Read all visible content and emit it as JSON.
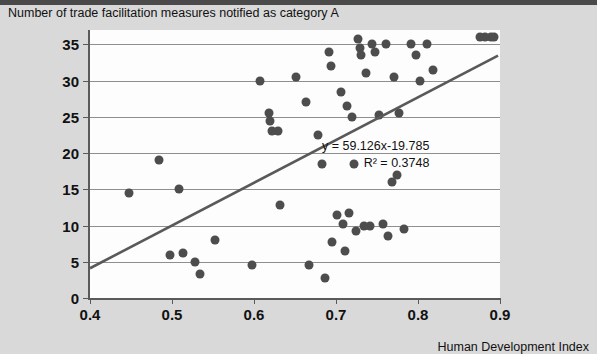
{
  "chart_data": {
    "type": "scatter",
    "title": "",
    "xlabel": "Human Development Index",
    "ylabel": "Number of trade facilitation measures notified as category A",
    "xlim": [
      0.4,
      0.9
    ],
    "ylim": [
      0,
      37
    ],
    "xticks": [
      "0.4",
      "0.5",
      "0.6",
      "0.7",
      "0.8",
      "0.9"
    ],
    "xtick_values": [
      0.4,
      0.5,
      0.6,
      0.7,
      0.8,
      0.9
    ],
    "yticks": [
      "0",
      "5",
      "10",
      "15",
      "20",
      "25",
      "30",
      "35"
    ],
    "ytick_values": [
      0,
      5,
      10,
      15,
      20,
      25,
      30,
      35
    ],
    "grid": "horizontal",
    "legend": "none",
    "annotations": [
      "y = 59.126x-19.785",
      "R² = 0.3748"
    ],
    "trendline": {
      "type": "linear",
      "equation": "y = 59.126x-19.785",
      "slope": 59.126,
      "intercept": -19.785,
      "r_squared": 0.3748,
      "x_start": 0.4,
      "x_end": 0.9,
      "y_start": 3.86,
      "y_end": 33.43,
      "color": "#595959"
    },
    "point_color": "#4d4d4d",
    "points": [
      [
        0.447,
        14.5
      ],
      [
        0.484,
        19.0
      ],
      [
        0.497,
        6.0
      ],
      [
        0.508,
        15.0
      ],
      [
        0.513,
        6.2
      ],
      [
        0.528,
        5.0
      ],
      [
        0.534,
        3.3
      ],
      [
        0.553,
        8.0
      ],
      [
        0.597,
        4.5
      ],
      [
        0.607,
        30.0
      ],
      [
        0.618,
        25.5
      ],
      [
        0.619,
        24.5
      ],
      [
        0.622,
        23.0
      ],
      [
        0.629,
        23.0
      ],
      [
        0.632,
        12.8
      ],
      [
        0.651,
        30.5
      ],
      [
        0.663,
        27.0
      ],
      [
        0.667,
        4.5
      ],
      [
        0.678,
        22.5
      ],
      [
        0.683,
        18.5
      ],
      [
        0.687,
        2.8
      ],
      [
        0.691,
        34.0
      ],
      [
        0.694,
        32.0
      ],
      [
        0.695,
        7.8
      ],
      [
        0.701,
        11.5
      ],
      [
        0.706,
        28.5
      ],
      [
        0.708,
        10.2
      ],
      [
        0.711,
        6.5
      ],
      [
        0.714,
        26.5
      ],
      [
        0.716,
        11.8
      ],
      [
        0.719,
        25.0
      ],
      [
        0.722,
        18.5
      ],
      [
        0.724,
        9.2
      ],
      [
        0.727,
        35.8
      ],
      [
        0.729,
        34.5
      ],
      [
        0.731,
        33.5
      ],
      [
        0.734,
        10.0
      ],
      [
        0.737,
        31.0
      ],
      [
        0.741,
        10.0
      ],
      [
        0.744,
        35.0
      ],
      [
        0.748,
        34.0
      ],
      [
        0.752,
        25.2
      ],
      [
        0.757,
        10.2
      ],
      [
        0.761,
        35.0
      ],
      [
        0.764,
        8.5
      ],
      [
        0.768,
        16.0
      ],
      [
        0.771,
        30.5
      ],
      [
        0.774,
        17.0
      ],
      [
        0.777,
        25.5
      ],
      [
        0.783,
        9.5
      ],
      [
        0.792,
        35.0
      ],
      [
        0.798,
        33.5
      ],
      [
        0.802,
        30.0
      ],
      [
        0.811,
        35.0
      ],
      [
        0.818,
        31.5
      ],
      [
        0.876,
        36.0
      ],
      [
        0.882,
        36.0
      ],
      [
        0.889,
        36.0
      ],
      [
        0.893,
        36.0
      ]
    ]
  }
}
